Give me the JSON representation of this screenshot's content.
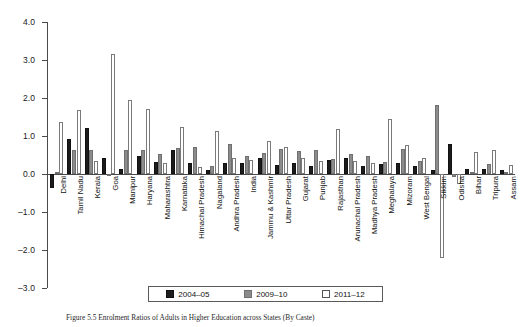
{
  "caption": {
    "label": "Figure 5.5",
    "text": "Figure 5.5   Enrolment Ratios of Adults in Higher Education across States (By Caste)"
  },
  "legend": {
    "position": "bottom-center",
    "items": [
      {
        "label": "2004–05",
        "color": "#1c1c1c",
        "swatch": "filled-black"
      },
      {
        "label": "2009–10",
        "color": "#8c8c8c",
        "swatch": "filled-gray"
      },
      {
        "label": "2011–12",
        "color": "#ffffff",
        "swatch": "outline-white"
      }
    ]
  },
  "axes": {
    "ylabel": "",
    "xlabel": "",
    "ylim": [
      -3.0,
      4.0
    ],
    "ytick_step": 1.0,
    "yticks": [
      "4.0",
      "3.0",
      "2.0",
      "1.0",
      "0.0",
      "–1.0",
      "–2.0",
      "–3.0"
    ],
    "ytick_values": [
      4.0,
      3.0,
      2.0,
      1.0,
      0.0,
      -1.0,
      -2.0,
      -3.0
    ],
    "grid": false
  },
  "chart_data": {
    "type": "bar",
    "title": "",
    "xlabel": "",
    "ylabel": "",
    "ylim": [
      -3.0,
      4.0
    ],
    "grid": false,
    "legend_position": "bottom-center",
    "categories": [
      "Delhi",
      "Tamil Nadu",
      "Kerala",
      "Goa",
      "Manipur",
      "Haryana",
      "Maharashtra",
      "Karnataka",
      "Himachal Pradesh",
      "Nagaland",
      "Andhra Pradesh",
      "India",
      "Jammu & Kashmir",
      "Uttar Pradesh",
      "Gujarat",
      "Punjab",
      "Rajasthan",
      "Arunachal Pradesh",
      "Madhya Pradesh",
      "Meghalaya",
      "Mizoram",
      "West Bengal",
      "Sikkim",
      "Odisha",
      "Bihar",
      "Tripura",
      "Assam"
    ],
    "series": [
      {
        "name": "2004–05",
        "color": "#1c1c1c",
        "values": [
          -0.38,
          0.92,
          1.22,
          0.42,
          0.13,
          0.48,
          0.32,
          0.62,
          0.28,
          0.1,
          0.3,
          0.28,
          0.42,
          0.24,
          0.3,
          0.22,
          0.36,
          0.42,
          0.22,
          0.26,
          0.3,
          0.2,
          0.1,
          0.78,
          0.12,
          0.14,
          0.1
        ]
      },
      {
        "name": "2009–10",
        "color": "#8c8c8c",
        "values": [
          0.06,
          0.62,
          0.62,
          0.0,
          0.64,
          0.64,
          0.52,
          0.68,
          0.72,
          0.22,
          0.78,
          0.48,
          0.54,
          0.66,
          0.6,
          0.62,
          0.4,
          0.52,
          0.48,
          0.32,
          0.66,
          0.34,
          1.82,
          -0.08,
          0.04,
          0.26,
          0.06
        ]
      },
      {
        "name": "2011–12",
        "color": "#ffffff",
        "values": [
          1.36,
          1.68,
          0.34,
          3.16,
          1.96,
          1.7,
          0.3,
          1.24,
          0.18,
          1.12,
          0.42,
          0.36,
          0.86,
          0.72,
          0.42,
          0.34,
          1.18,
          0.34,
          0.3,
          1.44,
          0.76,
          0.42,
          -2.22,
          -0.26,
          0.58,
          0.64,
          0.24
        ]
      }
    ]
  }
}
